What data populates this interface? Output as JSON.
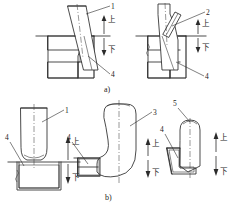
{
  "document": {
    "type": "engineering-drawing",
    "subject": "die-forging-billet-positioning",
    "background_color": "#ffffff",
    "line_color": "#2b2b2b",
    "width": 236,
    "height": 208
  },
  "captions": {
    "row_a": "a)",
    "row_b": "b)"
  },
  "force_labels": {
    "upper": "上",
    "lower": "下"
  },
  "figures": [
    {
      "id": "fig-a1",
      "row": "a)",
      "position": "top-left",
      "description": "straight tapered punch seated in hatched die cavity",
      "callouts": [
        {
          "number": "1",
          "target": "punch-body"
        },
        {
          "number": "4",
          "target": "die-cavity-wall"
        }
      ],
      "force_arrow": {
        "upper": "上",
        "lower": "下"
      }
    },
    {
      "id": "fig-a2",
      "row": "a)",
      "position": "top-right",
      "description": "punch with inclined bar element seated in hatched die cavity",
      "callouts": [
        {
          "number": "2",
          "target": "inclined-bar"
        },
        {
          "number": "4",
          "target": "die-cavity-wall"
        }
      ],
      "force_arrow": {
        "upper": "上",
        "lower": "下"
      }
    },
    {
      "id": "fig-b1",
      "row": "b)",
      "position": "bottom-left",
      "description": "cylindrical billet with rounded shoulder resting on hatched die block",
      "callouts": [
        {
          "number": "1",
          "target": "cylindrical-billet"
        },
        {
          "number": "4",
          "target": "die-block"
        }
      ],
      "force_arrow": {
        "upper": "上",
        "lower": "下"
      }
    },
    {
      "id": "fig-b2",
      "row": "b)",
      "position": "bottom-center",
      "description": "bulged L-shaped forging with curved flank on hatched die flange",
      "callouts": [
        {
          "number": "3",
          "target": "bulged-forging"
        },
        {
          "number": "4",
          "target": "die-flange"
        }
      ],
      "force_arrow": {
        "upper": "上",
        "lower": "下"
      }
    },
    {
      "id": "fig-b3",
      "row": "b)",
      "position": "bottom-right",
      "description": "dome-topped slender forging on inclined hatched die seat",
      "callouts": [
        {
          "number": "5",
          "target": "dome-top-forging"
        },
        {
          "number": "4",
          "target": "die-seat"
        }
      ],
      "force_arrow": {
        "upper": "上",
        "lower": "下"
      }
    }
  ],
  "callout_numbers": [
    "1",
    "2",
    "3",
    "4",
    "5"
  ]
}
